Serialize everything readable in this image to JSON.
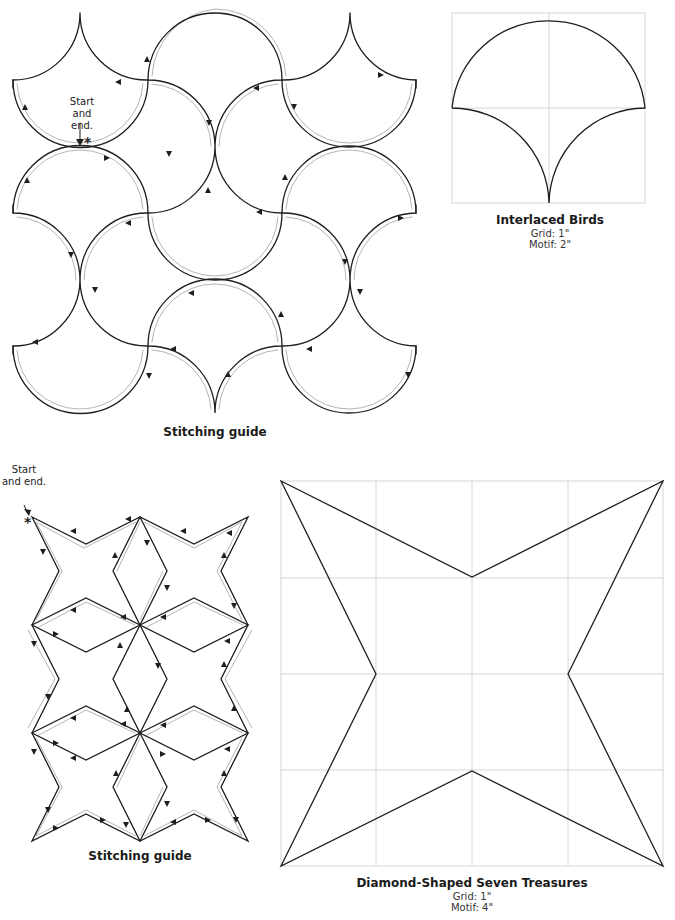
{
  "figures": {
    "interlaced_stitching": {
      "caption": "Stitching guide",
      "note_line1": "Start",
      "note_line2": "and end.",
      "start_marker": "*"
    },
    "interlaced_birds": {
      "title": "Interlaced Birds",
      "grid": "Grid: 1\"",
      "motif": "Motif: 2\""
    },
    "diamond_stitching": {
      "caption": "Stitching guide",
      "note_line1": "Start",
      "note_line2": "and end.",
      "start_marker": "*"
    },
    "diamond_treasures": {
      "title": "Diamond-Shaped Seven Treasures",
      "grid": "Grid: 1\"",
      "motif": "Motif: 4\""
    }
  },
  "colors": {
    "line": "#1e1e1e",
    "guide_line": "#b5b5b5",
    "grid_line": "#d6d6d6"
  }
}
